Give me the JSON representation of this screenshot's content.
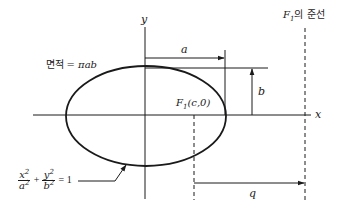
{
  "diagram": {
    "type": "ellipse-focus-directrix",
    "labels": {
      "y_axis": "y",
      "x_axis": "x",
      "semi_major": "a",
      "semi_minor": "b",
      "area_label": "면적",
      "area_formula": "= πab",
      "focus_F": "F",
      "focus_sub": "1",
      "focus_coords": "(c,0)",
      "directrix_F": "F",
      "directrix_sub": "1",
      "directrix_text": "의 준선",
      "distance_q": "q",
      "eq_x_num": "x",
      "eq_x_den": "a",
      "eq_y_num": "y",
      "eq_y_den": "b",
      "eq_exp": "2",
      "eq_plus": "+",
      "eq_rhs": "= 1"
    },
    "colors": {
      "stroke": "#1a1a1a",
      "background": "#ffffff"
    }
  }
}
